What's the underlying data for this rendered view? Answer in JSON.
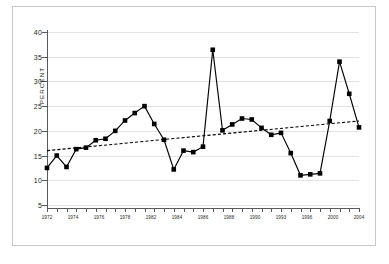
{
  "chart_data": {
    "type": "line",
    "title": "",
    "xlabel": "",
    "ylabel": "PERCENT",
    "ylim": [
      0,
      40
    ],
    "xlim": [
      1972,
      2004
    ],
    "grid": true,
    "legend": false,
    "y_ticks": [
      5,
      10,
      15,
      20,
      25,
      30,
      35,
      40
    ],
    "x_tick_labels": [
      "1972",
      "1974",
      "1976",
      "1978",
      "1982",
      "1984",
      "1986",
      "1988",
      "1990",
      "1993",
      "1996",
      "2000",
      "2004"
    ],
    "x": [
      1972,
      1973,
      1974,
      1975,
      1976,
      1977,
      1978,
      1979,
      1980,
      1981,
      1982,
      1983,
      1984,
      1985,
      1986,
      1987,
      1988,
      1989,
      1990,
      1991,
      1992,
      1993,
      1994,
      1995,
      1996,
      1997,
      1998,
      1999,
      2000,
      2001,
      2002,
      2003,
      2004
    ],
    "series": [
      {
        "name": "Percent",
        "style": "solid-with-square-markers",
        "values": [
          12.5,
          15.0,
          12.7,
          16.3,
          16.6,
          18.1,
          18.4,
          20.0,
          22.1,
          23.6,
          25.0,
          21.4,
          18.2,
          12.2,
          16.0,
          15.7,
          16.8,
          36.4,
          20.1,
          21.3,
          22.5,
          22.3,
          20.6,
          19.2,
          19.6,
          15.5,
          11.0,
          11.2,
          11.4,
          22.0,
          34.0,
          27.5,
          20.7
        ]
      },
      {
        "name": "Linear trend",
        "style": "dashed",
        "endpoints": [
          [
            1972,
            16.0
          ],
          [
            2004,
            22.0
          ]
        ]
      }
    ]
  },
  "axes": {
    "y_title": "PERCENT"
  },
  "caption": ""
}
